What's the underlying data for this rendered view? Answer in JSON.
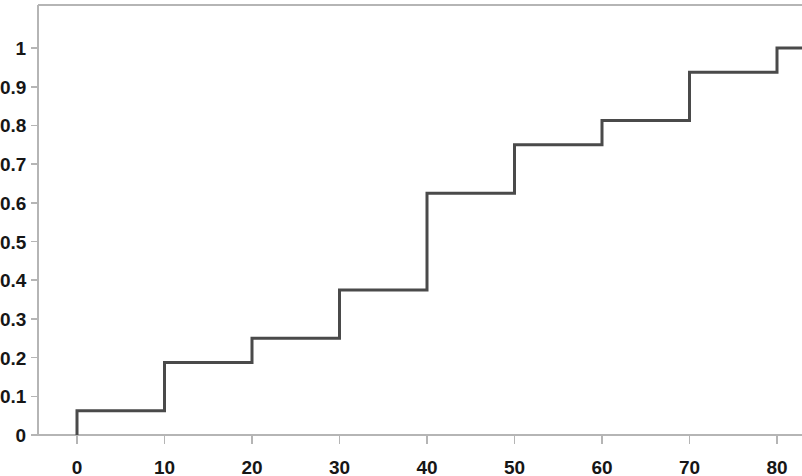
{
  "chart_data": {
    "type": "line",
    "subtype": "step-ecdf",
    "title": "",
    "xlabel": "",
    "ylabel": "",
    "xlim": [
      -5,
      85
    ],
    "ylim": [
      0,
      1.03
    ],
    "grid": false,
    "legend": false,
    "x_ticks": [
      0,
      10,
      20,
      30,
      40,
      50,
      60,
      70,
      80
    ],
    "x_tick_labels": [
      "0",
      "10",
      "20",
      "30",
      "40",
      "50",
      "60",
      "70",
      "80"
    ],
    "y_ticks": [
      0,
      0.1,
      0.2,
      0.3,
      0.4,
      0.5,
      0.6,
      0.7,
      0.8,
      0.9,
      1
    ],
    "y_tick_labels": [
      "0",
      "0.1",
      "0.2",
      "0.3",
      "0.4",
      "0.5",
      "0.6",
      "0.7",
      "0.8",
      "0.9",
      "1"
    ],
    "step_style": "post",
    "x": [
      0,
      10,
      20,
      30,
      40,
      50,
      60,
      70,
      80
    ],
    "values": [
      0.0625,
      0.1875,
      0.25,
      0.375,
      0.625,
      0.75,
      0.8125,
      0.9375,
      1
    ],
    "series": [
      {
        "name": "cumulative relative frequency",
        "x": [
          0,
          10,
          20,
          30,
          40,
          50,
          60,
          70,
          80
        ],
        "values": [
          0.0625,
          0.1875,
          0.25,
          0.375,
          0.625,
          0.75,
          0.8125,
          0.9375,
          1
        ]
      }
    ],
    "baseline_value": 0,
    "line_color": "#4a4a4a",
    "axis_color": "#b5b5b5",
    "background_color": "#ffffff",
    "line_width": 3
  },
  "geometry": {
    "plot_left_px": 38,
    "plot_top_px": 5,
    "plot_bottom_px": 435,
    "x_origin_px": 77,
    "x_px_per_unit": 8.75,
    "y_zero_px": 435,
    "y_px_per_unit": 387
  }
}
